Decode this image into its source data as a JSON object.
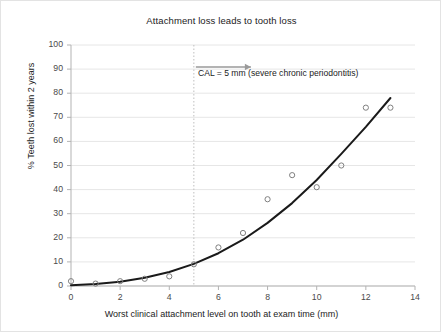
{
  "chart_data": {
    "type": "scatter",
    "title": "Attachment loss leads to tooth loss",
    "xlabel": "Worst clinical attachment level on tooth at exam time (mm)",
    "ylabel": "% Teeth lost within 2 years",
    "xlim": [
      0,
      14
    ],
    "ylim": [
      0,
      100
    ],
    "xticks": [
      0,
      2,
      4,
      6,
      8,
      10,
      12,
      14
    ],
    "yticks": [
      0,
      10,
      20,
      30,
      40,
      50,
      60,
      70,
      80,
      90,
      100
    ],
    "grid": "horizontal",
    "legend": "none",
    "x": [
      0,
      1,
      2,
      3,
      4,
      5,
      6,
      7,
      8,
      9,
      10,
      11,
      12,
      13
    ],
    "values": [
      2,
      1,
      2,
      3,
      4,
      9,
      16,
      22,
      36,
      46,
      41,
      50,
      74,
      74
    ],
    "series": [
      {
        "name": "Observed % teeth lost",
        "type": "scatter",
        "marker": "open-circle",
        "x": [
          0,
          1,
          2,
          3,
          4,
          5,
          6,
          7,
          8,
          9,
          10,
          11,
          12,
          13
        ],
        "values": [
          2,
          1,
          2,
          3,
          4,
          9,
          16,
          22,
          36,
          46,
          41,
          50,
          74,
          74
        ]
      },
      {
        "name": "Fitted trend curve",
        "type": "line",
        "x": [
          0,
          1,
          2,
          3,
          4,
          5,
          6,
          7,
          8,
          9,
          10,
          11,
          12,
          13
        ],
        "values": [
          0.3,
          0.8,
          1.8,
          3.4,
          5.8,
          9.2,
          13.6,
          19.2,
          26.2,
          34.4,
          44.0,
          54.8,
          66.0,
          78.0
        ]
      }
    ],
    "annotations": [
      {
        "name": "cal-threshold",
        "text": "CAL = 5 mm (severe chronic periodontitis)",
        "x": 5,
        "marker": "vertical-dotted-line",
        "arrow": "right"
      }
    ]
  },
  "colors": {
    "curve": "#1a1a1a",
    "marker_stroke": "#808080",
    "gridline": "#e6e6e6",
    "axis": "#b3b3b3",
    "annotation_line": "#bfbfbf",
    "annotation_arrow": "#9a9a9a",
    "text": "#1b1b1b",
    "tick_text": "#4a4a4a"
  }
}
